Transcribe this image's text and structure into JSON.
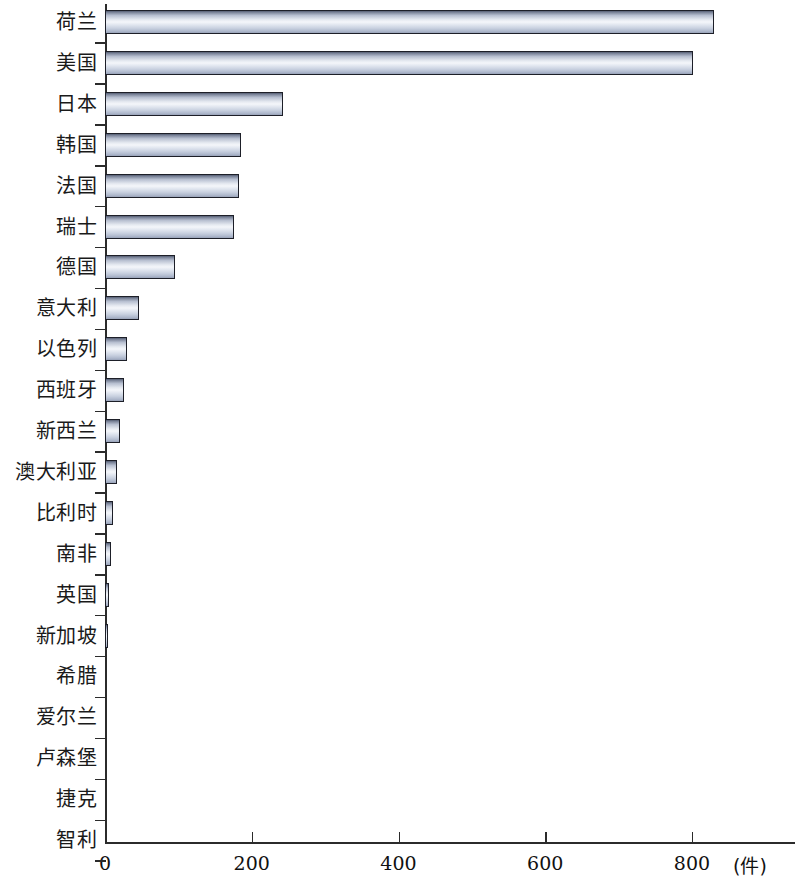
{
  "chart_data": {
    "type": "bar",
    "orientation": "horizontal",
    "title": "",
    "subtitle": "",
    "xlabel": "(件)",
    "ylabel": "",
    "unit": "件",
    "xlim": [
      0,
      880
    ],
    "x_ticks": [
      0,
      200,
      400,
      600,
      800
    ],
    "x_tick_labels": [
      "0",
      "200",
      "400",
      "600",
      "800"
    ],
    "grid": false,
    "legend": false,
    "categories": [
      "荷兰",
      "美国",
      "日本",
      "韩国",
      "法国",
      "瑞士",
      "德国",
      "意大利",
      "以色列",
      "西班牙",
      "新西兰",
      "澳大利亚",
      "比利时",
      "南非",
      "英国",
      "新加坡",
      "希腊",
      "爱尔兰",
      "卢森堡",
      "捷克",
      "智利"
    ],
    "values": [
      830,
      802,
      242,
      185,
      182,
      176,
      95,
      46,
      30,
      26,
      20,
      17,
      11,
      8,
      5,
      4,
      1,
      1,
      1,
      1,
      0
    ],
    "bar_colors": {
      "fill_light": "#f4f6fa",
      "fill_mid": "#c9d1e0",
      "fill_dark": "#545d72",
      "edge": "#1d1f28"
    },
    "axis_color": "#2b2b2b"
  }
}
